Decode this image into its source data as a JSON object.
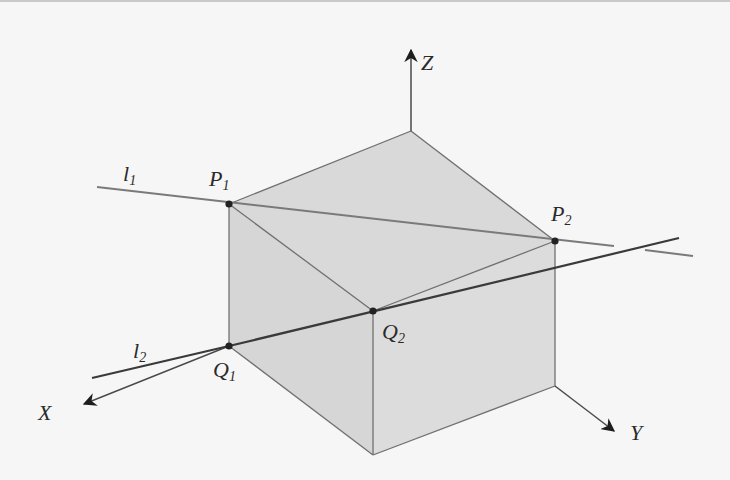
{
  "colors": {
    "background": "#f6f6f6",
    "face_fill": "#d9d9d9",
    "edge": "#6e6e6e",
    "line_l1": "#7a7a7a",
    "line_l2": "#3a3a3a",
    "point": "#222222",
    "axis": "#4a4a4a"
  },
  "labels": {
    "z_axis": "Z",
    "x_axis": "X",
    "y_axis": "Y",
    "l1": {
      "base": "l",
      "sub": "1"
    },
    "l2": {
      "base": "l",
      "sub": "2"
    },
    "P1": {
      "base": "P",
      "sub": "1"
    },
    "P2": {
      "base": "P",
      "sub": "2"
    },
    "Q1": {
      "base": "Q",
      "sub": "1"
    },
    "Q2": {
      "base": "Q",
      "sub": "2"
    }
  },
  "points": {
    "top": [
      411,
      131
    ],
    "P1": [
      229,
      204
    ],
    "P2": [
      555,
      241
    ],
    "Q1": [
      229,
      346
    ],
    "Q2": [
      373,
      311
    ],
    "bottom_front": [
      373,
      455
    ],
    "bottom_right": [
      555,
      386
    ]
  }
}
